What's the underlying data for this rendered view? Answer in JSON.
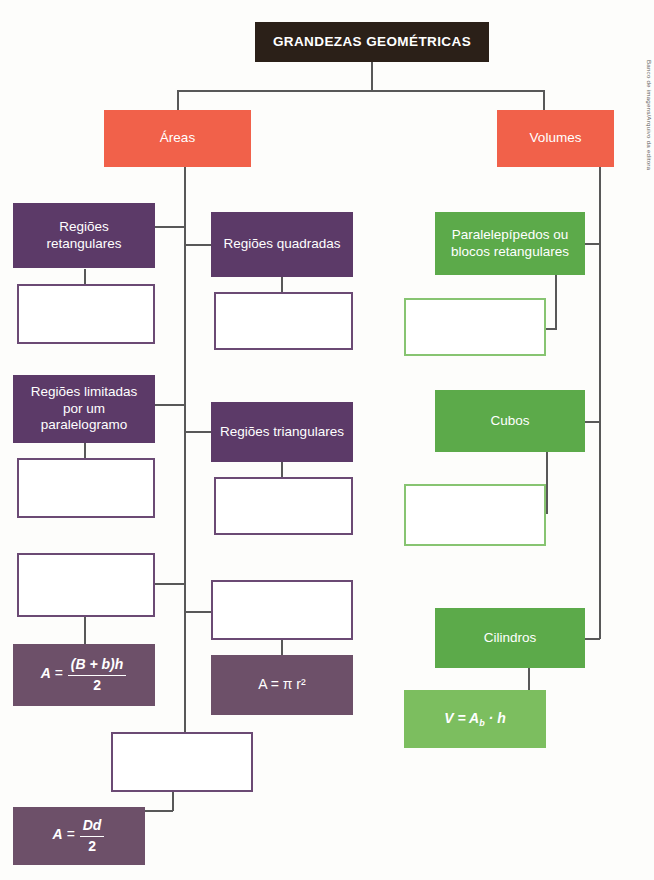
{
  "title": {
    "label": "GRANDEZAS GEOMÉTRICAS"
  },
  "branches": {
    "areas": {
      "label": "Áreas"
    },
    "volumes": {
      "label": "Volumes"
    }
  },
  "areas_left_column": [
    {
      "label": "Regiões retangulares"
    },
    {
      "label": "Regiões limitadas por um paralelogramo"
    }
  ],
  "areas_middle_column": [
    {
      "label": "Regiões quadradas"
    },
    {
      "label": "Regiões triangulares"
    }
  ],
  "volumes_column": [
    {
      "label": "Paralelepípedos ou blocos retangulares"
    },
    {
      "label": "Cubos"
    },
    {
      "label": "Cilindros"
    }
  ],
  "formulas": {
    "trapezoid": {
      "lhs": "A",
      "eq": "=",
      "num": "(B + b)h",
      "den": "2"
    },
    "circle": {
      "text": "A = π r²"
    },
    "rhombus": {
      "lhs": "A",
      "eq": "=",
      "num": "Dd",
      "den": "2"
    },
    "cylinder": {
      "text": "V = A",
      "sub": "b",
      "rest": "· h"
    }
  },
  "colors": {
    "title_bg": "#2b2018",
    "orange": "#f1614a",
    "purple": "#5c3a68",
    "purple_outline": "#6b4a74",
    "purple_formula": "#6d5069",
    "green": "#5caa4a",
    "green_outline": "#87c471",
    "green_formula": "#7cbe5f",
    "line": "#585858"
  },
  "credit": {
    "text": "Banco de imagens/Arquivo da editora"
  }
}
